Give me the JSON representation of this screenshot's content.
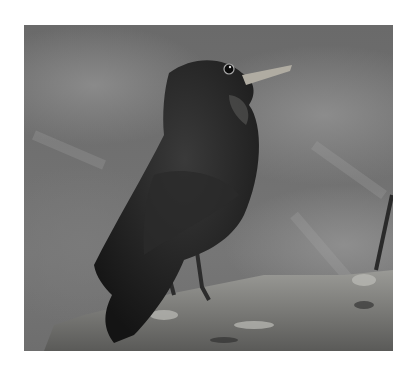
{
  "image": {
    "subject": "blackbird perched on log",
    "style": "grayscale photograph",
    "colors": {
      "background": "#ffffff",
      "photo_bg": "#707070",
      "bird": "#1a1a1a",
      "beak": "#b0aca2",
      "log": "#8a8a86"
    }
  }
}
